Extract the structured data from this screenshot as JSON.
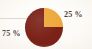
{
  "chart_data": {
    "type": "pie",
    "title": "",
    "categories": [
      "Segment A",
      "Segment B"
    ],
    "values": [
      25,
      75
    ],
    "labels": [
      "25 %",
      "75 %"
    ],
    "colors": [
      "#efa83b",
      "#7b2217"
    ],
    "legend": "none",
    "grid": false,
    "annotations": {
      "top_cropped_text": "",
      "note": "Two-slice pie: 25% gold wedge in top-right quadrant, 75% dark red remainder"
    }
  },
  "chart": {
    "slice_25": {
      "label": "25 %",
      "value": 25,
      "color": "#efa83b"
    },
    "slice_75": {
      "label": "75 %",
      "value": 75,
      "color": "#7b2217"
    }
  },
  "page": {
    "background_color": "#fdfcfa",
    "text_color": "#4b4038",
    "top_cropped_text": ""
  }
}
